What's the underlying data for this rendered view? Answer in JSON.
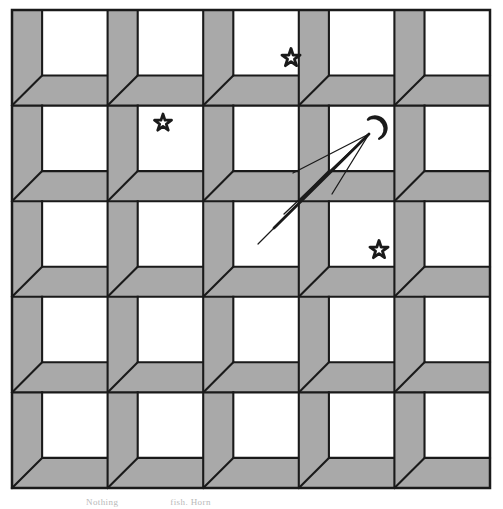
{
  "figure": {
    "background_color": "#ffffff",
    "box_fill_color": "#a9a9a9",
    "inner_face_color": "#ffffff",
    "stroke_color": "#1a1a1a"
  },
  "grid": {
    "rows": 5,
    "columns": 5,
    "origin_x": 12,
    "origin_y": 10,
    "cell_size": 95.6,
    "band_ratio": 0.315,
    "stroke_width": 2.1,
    "outer_border": true
  },
  "markers": {
    "stars": [
      {
        "name": "star-top-right-cell",
        "label": "star",
        "x": 291,
        "y": 58,
        "size": 9.5,
        "row": 1,
        "col": 4
      },
      {
        "name": "star-middle-left-cell",
        "label": "star",
        "x": 163,
        "y": 123,
        "size": 9.0,
        "row": 2,
        "col": 2
      },
      {
        "name": "star-lower-right-cell",
        "label": "star",
        "x": 379,
        "y": 250,
        "size": 9.5,
        "row": 3,
        "col": 4
      }
    ],
    "moon": {
      "name": "crescent-moon",
      "label": "moon",
      "x": 375,
      "y": 128,
      "size": 11.5,
      "rotation": -28
    },
    "sight_lines": {
      "name": "converging-sight-lines",
      "label": "sight lines",
      "apex_x": 369,
      "apex_y": 134,
      "rays": [
        {
          "name": "ray-thick-long",
          "x2": 274,
          "y2": 228,
          "width": 2.8
        },
        {
          "name": "ray-thin-upper",
          "x2": 293,
          "y2": 173,
          "width": 1.3
        },
        {
          "name": "ray-thin-middle",
          "x2": 284,
          "y2": 214,
          "width": 1.3
        },
        {
          "name": "ray-thin-lower",
          "x2": 332,
          "y2": 194,
          "width": 1.3
        }
      ]
    }
  },
  "caption": {
    "text_fragment_left": "Nothing",
    "text_fragment_right": "fish. Horn",
    "visible": true
  }
}
